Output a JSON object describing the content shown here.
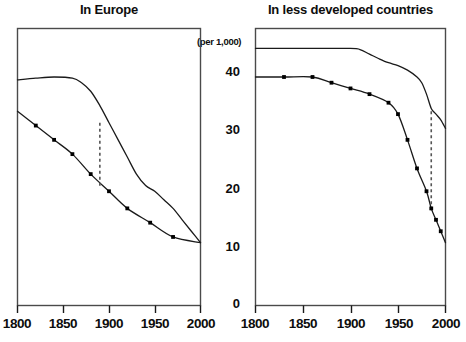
{
  "figure": {
    "unit_label": "(per 1,000)",
    "panels": [
      {
        "id": "europe",
        "title": "In Europe",
        "xticks": [
          "1800",
          "1850",
          "1900",
          "1950",
          "2000"
        ]
      },
      {
        "id": "less-developed",
        "title": "In less developed countries",
        "xticks": [
          "1800",
          "1850",
          "1900",
          "1950",
          "2000"
        ]
      }
    ],
    "yticks": [
      "40",
      "30",
      "20",
      "10",
      "0"
    ],
    "colors": {
      "ink": "#0d0d0d",
      "frame": "#3a3a3a",
      "curve": "#1a1a1a",
      "marker": "#000000",
      "dashed": "#555555",
      "background": "#ffffff"
    }
  },
  "chart_data": [
    {
      "type": "line",
      "title": "In Europe",
      "xlabel": "",
      "ylabel": "(per 1,000)",
      "xlim": [
        1800,
        2000
      ],
      "ylim": [
        0,
        45
      ],
      "yticks": [
        0,
        10,
        20,
        30,
        40
      ],
      "xticks": [
        1800,
        1850,
        1900,
        1950,
        2000
      ],
      "grid": false,
      "legend": "none",
      "annotations": [
        {
          "kind": "vertical-dashed-line",
          "x": 1890,
          "y_from": 32.0,
          "y_to": 20.5
        }
      ],
      "series": [
        {
          "name": "Birth rate",
          "markers": false,
          "x": [
            1800,
            1820,
            1840,
            1860,
            1870,
            1880,
            1890,
            1900,
            1910,
            1920,
            1930,
            1940,
            1950,
            1960,
            1970,
            1980,
            1990,
            2000
          ],
          "values": [
            39.5,
            39.8,
            40.0,
            39.8,
            39.0,
            37.5,
            35.0,
            32.0,
            29.0,
            26.0,
            23.0,
            21.0,
            20.0,
            18.5,
            17.0,
            15.0,
            13.0,
            11.0
          ]
        },
        {
          "name": "Death rate",
          "markers": true,
          "x": [
            1800,
            1820,
            1840,
            1860,
            1880,
            1900,
            1920,
            1945,
            1970,
            2000
          ],
          "values": [
            34.0,
            31.5,
            29.0,
            26.5,
            23.0,
            20.0,
            17.0,
            14.5,
            12.0,
            11.0
          ]
        }
      ]
    },
    {
      "type": "line",
      "title": "In less developed countries",
      "xlabel": "",
      "ylabel": "(per 1,000)",
      "xlim": [
        1800,
        2000
      ],
      "ylim": [
        0,
        45
      ],
      "yticks": [
        0,
        10,
        20,
        30,
        40
      ],
      "xticks": [
        1800,
        1850,
        1900,
        1950,
        2000
      ],
      "grid": false,
      "legend": "none",
      "annotations": [
        {
          "kind": "vertical-dashed-line",
          "x": 1985,
          "y_from": 34.0,
          "y_to": 16.5
        }
      ],
      "series": [
        {
          "name": "Birth rate",
          "markers": false,
          "x": [
            1800,
            1850,
            1900,
            1910,
            1920,
            1930,
            1940,
            1950,
            1960,
            1970,
            1975,
            1980,
            1985,
            1990,
            1995,
            2000
          ],
          "values": [
            45.0,
            45.0,
            45.0,
            44.8,
            44.0,
            43.2,
            42.5,
            42.0,
            41.2,
            40.0,
            39.0,
            37.0,
            34.5,
            33.5,
            32.5,
            31.0
          ]
        },
        {
          "name": "Death rate",
          "markers": true,
          "x": [
            1800,
            1830,
            1860,
            1880,
            1900,
            1920,
            1940,
            1950,
            1960,
            1970,
            1980,
            1985,
            1990,
            1995,
            2000
          ],
          "values": [
            40.0,
            40.0,
            40.0,
            39.0,
            38.0,
            37.0,
            35.5,
            33.5,
            29.0,
            24.0,
            20.0,
            17.0,
            15.0,
            13.0,
            11.0
          ]
        }
      ]
    }
  ]
}
